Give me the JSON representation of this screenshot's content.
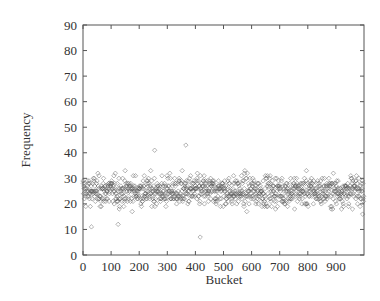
{
  "chart_data": {
    "type": "scatter",
    "title": "",
    "xlabel": "Bucket",
    "ylabel": "Frequency",
    "xlim": [
      0,
      1000
    ],
    "ylim": [
      0,
      90
    ],
    "xticks": [
      0,
      100,
      200,
      300,
      400,
      500,
      600,
      700,
      800,
      900
    ],
    "yticks": [
      0,
      10,
      20,
      30,
      40,
      50,
      60,
      70,
      80,
      90
    ],
    "grid": false,
    "legend": null,
    "marker": "open-diamond",
    "marker_color": "#555555",
    "series": [
      {
        "name": "frequency per bucket",
        "description": "~1000 buckets, values mostly between 15 and 38, dense band around 20-30, mean ~25",
        "distribution": {
          "count": 1000,
          "mean": 25,
          "min_typical": 13,
          "max_typical": 38
        },
        "outliers": [
          {
            "x": 366,
            "y": 43
          },
          {
            "x": 417,
            "y": 7
          },
          {
            "x": 255,
            "y": 41
          },
          {
            "x": 30,
            "y": 11
          },
          {
            "x": 125,
            "y": 12
          }
        ]
      }
    ]
  },
  "axes": {
    "x_title": "Bucket",
    "y_title": "Frequency",
    "x_tick_labels": [
      "0",
      "100",
      "200",
      "300",
      "400",
      "500",
      "600",
      "700",
      "800",
      "900"
    ],
    "y_tick_labels": [
      "0",
      "10",
      "20",
      "30",
      "40",
      "50",
      "60",
      "70",
      "80",
      "90"
    ]
  }
}
